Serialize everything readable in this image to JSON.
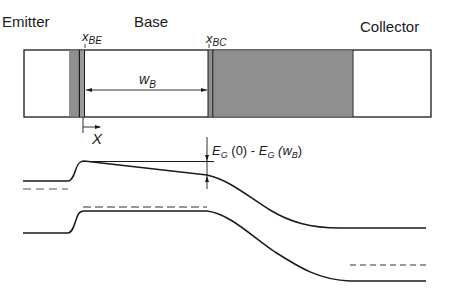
{
  "regions": {
    "emitter": "Emitter",
    "base": "Base",
    "collector": "Collector"
  },
  "markers": {
    "x_be": {
      "main": "x",
      "sub": "BE"
    },
    "x_bc": {
      "main": "x",
      "sub": "BC"
    },
    "w_b": {
      "main": "w",
      "sub": "B"
    },
    "x_axis": "X"
  },
  "annotation": {
    "e1": "E",
    "e1_sub": "G",
    "e1_arg": " (0) - ",
    "e2": "E",
    "e2_sub": "G",
    "e2_arg_open": " (w",
    "e2_arg_sub": "B",
    "e2_arg_close": ")"
  },
  "colors": {
    "line": "#1a1a1a",
    "depletion_fill": "#8f8f8f",
    "background": "#ffffff"
  }
}
